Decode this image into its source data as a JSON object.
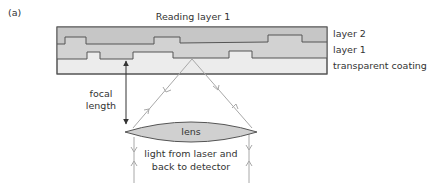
{
  "figure": {
    "panel_label": "(a)",
    "title": "Reading layer 1"
  },
  "legend": {
    "layer2": "layer 2",
    "layer1": "layer 1",
    "coating": "transparent coating"
  },
  "annotations": {
    "focal_line1": "focal",
    "focal_line2": "length",
    "lens": "lens",
    "light_line1": "light from laser and",
    "light_line2": "back to detector"
  },
  "colors": {
    "layer2_fill": "#c8c8c8",
    "layer1_fill": "#d2d2d2",
    "coating_fill": "#ececec",
    "outline": "#555555",
    "ray": "#a8a8a8",
    "lens_fill": "#d0d0d0",
    "arrow": "#333333"
  }
}
